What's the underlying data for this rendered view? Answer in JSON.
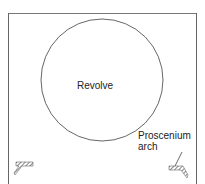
{
  "diagram": {
    "type": "stage-plan",
    "labels": {
      "revolve": "Revolve",
      "proscenium_line1": "Proscenium",
      "proscenium_line2": "arch"
    },
    "elements": [
      {
        "name": "stage-frame",
        "kind": "open-rectangle"
      },
      {
        "name": "revolve",
        "kind": "circle"
      },
      {
        "name": "proscenium-arch-left",
        "kind": "hatched-wall"
      },
      {
        "name": "proscenium-arch-right",
        "kind": "hatched-wall"
      }
    ],
    "colors": {
      "line": "#555555",
      "hatch": "#666666",
      "text": "#222222"
    }
  }
}
